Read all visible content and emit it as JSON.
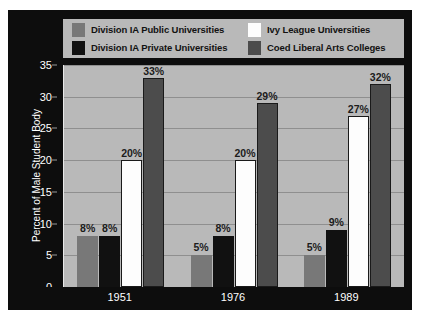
{
  "chart_data": {
    "type": "bar",
    "title": "",
    "xlabel": "",
    "ylabel": "Percent of Male Student Body",
    "categories": [
      "1951",
      "1976",
      "1989"
    ],
    "ylim": [
      0,
      35
    ],
    "yticks": [
      0,
      5,
      10,
      15,
      20,
      25,
      30,
      35
    ],
    "ytick_labels": [
      "0",
      "5",
      "10",
      "15",
      "20",
      "25",
      "30",
      "35"
    ],
    "grid": true,
    "legend_position": "top",
    "series": [
      {
        "name": "Division IA Public Universities",
        "color": "#787878",
        "values": [
          8,
          5,
          5
        ],
        "labels": [
          "8%",
          "5%",
          "5%"
        ]
      },
      {
        "name": "Division IA Private Universities",
        "color": "#111111",
        "values": [
          8,
          8,
          9
        ],
        "labels": [
          "8%",
          "8%",
          "9%"
        ]
      },
      {
        "name": "Ivy League Universities",
        "color": "#fdfdfd",
        "values": [
          20,
          20,
          27
        ],
        "labels": [
          "20%",
          "20%",
          "27%"
        ]
      },
      {
        "name": "Coed Liberal Arts Colleges",
        "color": "#4c4c4c",
        "values": [
          33,
          29,
          32
        ],
        "labels": [
          "33%",
          "29%",
          "32%"
        ]
      }
    ]
  },
  "legend": {
    "items": [
      {
        "label": "Division IA Public Universities",
        "color": "#787878"
      },
      {
        "label": "Division IA Private Universities",
        "color": "#111111"
      },
      {
        "label": "Ivy League Universities",
        "color": "#fdfdfd"
      },
      {
        "label": "Coed Liberal Arts Colleges",
        "color": "#4c4c4c"
      }
    ]
  },
  "colors": {
    "background": "#0d0d0d",
    "plot_background": "#b9b9b9",
    "gridline": "#8f8f8f",
    "tick_text": "#ffffff",
    "value_text": "#1c1c1c"
  }
}
